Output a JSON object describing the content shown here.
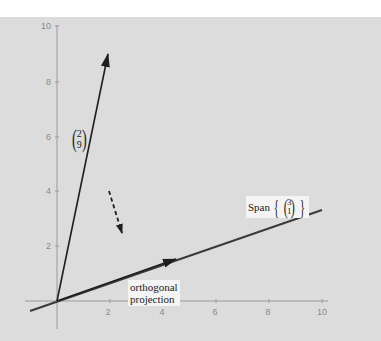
{
  "figure": {
    "background_color": "#dcdcdc",
    "axis_color": "#9a9a9a",
    "line_color": "#2a2a2a",
    "pixel_mapping": {
      "origin_px": [
        57,
        301
      ],
      "px_per_unit_x": 26.5,
      "px_per_unit_y": 27.6
    },
    "x_axis": {
      "ticks": [
        "2",
        "4",
        "6",
        "8",
        "10"
      ],
      "range": [
        -1,
        10
      ]
    },
    "y_axis": {
      "ticks": [
        "2",
        "4",
        "6",
        "8",
        "10"
      ],
      "range": [
        -1,
        10
      ]
    },
    "vector": {
      "components": [
        "2",
        "9"
      ],
      "label_top": "2",
      "label_bottom": "9"
    },
    "span_line": {
      "label_word": "Span",
      "direction_top": "3",
      "direction_bottom": "1"
    },
    "projection": {
      "label_line1": "orthogonal",
      "label_line2": "projection"
    },
    "dashed_arrow": {
      "meaning": "projection direction indicator"
    }
  }
}
